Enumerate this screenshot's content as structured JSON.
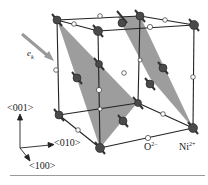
{
  "figure": {
    "beam_label": {
      "main": "e",
      "sub": "k"
    },
    "axes": {
      "z_label": "<001>",
      "y_label": "<010>",
      "x_label": "<100>"
    },
    "legend": {
      "oxygen": {
        "main": "O",
        "sup": "2−"
      },
      "nickel": {
        "main": "Ni",
        "sup": "2+"
      }
    },
    "colors": {
      "plane": "#8c8c8c",
      "edge": "#222222",
      "ni_atom": "#4a4a4a",
      "o_atom": "#ffffff",
      "arrow": "#b5b5b5"
    }
  }
}
